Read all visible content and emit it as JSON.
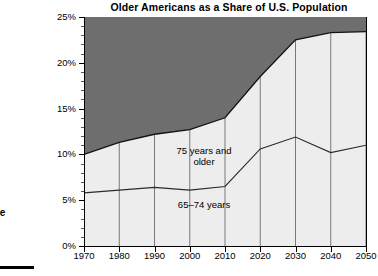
{
  "chart_data": {
    "type": "area",
    "title": "Older Americans as a Share of U.S. Population",
    "xlabel": "",
    "ylabel": "",
    "x": [
      1970,
      1980,
      1990,
      2000,
      2010,
      2020,
      2030,
      2040,
      2050
    ],
    "xticklabels": [
      "1970",
      "1980",
      "1990",
      "2000",
      "2010",
      "2020",
      "2030",
      "2040",
      "2050"
    ],
    "yticklabels": [
      "0%",
      "5%",
      "10%",
      "15%",
      "20%",
      "25%"
    ],
    "yticks": [
      0,
      5,
      10,
      15,
      20,
      25
    ],
    "ylim": [
      0,
      25
    ],
    "xlim": [
      1970,
      2050
    ],
    "yminor_step": 1,
    "grid": false,
    "stacked": true,
    "legend": "in-plot labels",
    "series": [
      {
        "name": "65–74 years",
        "values": [
          5.8,
          6.1,
          6.4,
          6.1,
          6.5,
          10.6,
          11.9,
          10.2,
          11.0
        ],
        "color": "#ededed"
      },
      {
        "name": "75 years and older",
        "values": [
          4.2,
          5.2,
          5.8,
          6.6,
          7.5,
          7.9,
          10.6,
          13.1,
          12.4
        ],
        "color": "#ededed"
      }
    ],
    "cumulative_total": [
      10.0,
      11.3,
      12.2,
      12.7,
      14.0,
      18.5,
      22.5,
      23.3,
      23.4
    ],
    "background_band": {
      "name": "remaining population share",
      "color": "#6e6e6e",
      "top": 25
    },
    "annotations": [
      {
        "id": "label-75",
        "text_line1": "75 years and",
        "text_line2": "older"
      },
      {
        "id": "label-6574",
        "text_line1": "65–74 years",
        "text_line2": ""
      }
    ]
  },
  "side_caption": {
    "line1": "ange",
    "line2": "au",
    "line3": "2)"
  }
}
